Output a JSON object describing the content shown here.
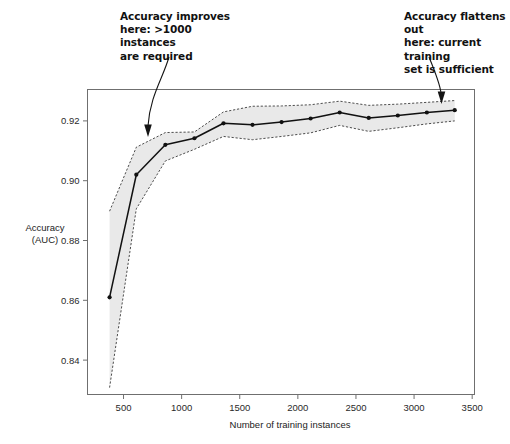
{
  "annotations": {
    "left": {
      "text": "Accuracy improves\nhere: >1000 instances\nare required",
      "target_x": 1000,
      "target_y": 0.9155
    },
    "right": {
      "text": "Accuracy flattens out\nhere: current training\nset is sufficient",
      "target_x": 3150,
      "target_y": 0.9255
    }
  },
  "chart_data": {
    "type": "line",
    "title": "",
    "xlabel": "Number of training instances",
    "ylabel": "Accuracy\n(AUC)",
    "xlim": [
      190,
      3520
    ],
    "ylim": [
      0.8285,
      0.9305
    ],
    "xticks": [
      500,
      1000,
      1500,
      2000,
      2500,
      3000,
      3500
    ],
    "xtick_labels": [
      "500",
      "1000",
      "1500",
      "2000",
      "2500",
      "3000",
      "3500"
    ],
    "yticks": [
      0.84,
      0.86,
      0.88,
      0.9,
      0.92
    ],
    "ytick_labels": [
      "0.84",
      "0.86",
      "0.88",
      "0.90",
      "0.92"
    ],
    "grid": false,
    "legend": "none",
    "x": [
      380,
      610,
      860,
      1110,
      1360,
      1610,
      1860,
      2110,
      2360,
      2610,
      2860,
      3110,
      3350
    ],
    "series": [
      {
        "name": "Accuracy (AUC)",
        "style": "solid-line-with-markers",
        "color": "#111111",
        "values": [
          0.861,
          0.902,
          0.912,
          0.9142,
          0.9192,
          0.9187,
          0.9196,
          0.9208,
          0.9228,
          0.921,
          0.9218,
          0.9228,
          0.9236
        ]
      },
      {
        "name": "Upper bound",
        "style": "dotted-line",
        "color": "#333333",
        "values": [
          0.8898,
          0.9112,
          0.9161,
          0.9163,
          0.923,
          0.9249,
          0.925,
          0.9254,
          0.9266,
          0.9252,
          0.9256,
          0.9262,
          0.9268
        ]
      },
      {
        "name": "Lower bound",
        "style": "dotted-line",
        "color": "#333333",
        "values": [
          0.8308,
          0.8906,
          0.9066,
          0.9105,
          0.9148,
          0.9137,
          0.9148,
          0.916,
          0.9185,
          0.9165,
          0.9177,
          0.919,
          0.92
        ]
      }
    ],
    "band": {
      "name": "confidence-band",
      "fill": "#e9e9e9",
      "between": [
        "Upper bound",
        "Lower bound"
      ]
    }
  },
  "colors": {
    "line": "#111111",
    "band_fill": "#e9e9e9",
    "band_edge": "#3a3a3a",
    "frame": "#6f6f6f",
    "tick_text": "#2a2a2a",
    "background": "#ffffff"
  }
}
